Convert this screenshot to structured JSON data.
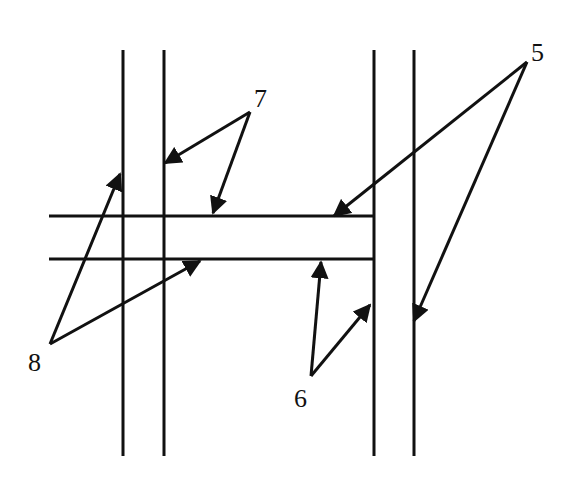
{
  "diagram": {
    "type": "structural-cross-section-schematic",
    "colors": {
      "line": "#111111",
      "background": "#ffffff"
    },
    "vertical_members": [
      {
        "id": "left-pair-outer",
        "x": 123,
        "y1": 50,
        "y2": 456
      },
      {
        "id": "left-pair-inner",
        "x": 164,
        "y1": 50,
        "y2": 456
      },
      {
        "id": "right-pair-inner",
        "x": 374,
        "y1": 50,
        "y2": 456
      },
      {
        "id": "right-pair-outer",
        "x": 414,
        "y1": 50,
        "y2": 456
      }
    ],
    "horizontal_members": [
      {
        "id": "beam-top",
        "y": 216,
        "x1": 49,
        "x2": 374
      },
      {
        "id": "beam-bottom",
        "y": 259,
        "x1": 49,
        "x2": 374
      }
    ],
    "labels": [
      {
        "id": "label-5",
        "text": "5",
        "x": 531,
        "y": 40
      },
      {
        "id": "label-6",
        "text": "6",
        "x": 294,
        "y": 386
      },
      {
        "id": "label-7",
        "text": "7",
        "x": 254,
        "y": 86
      },
      {
        "id": "label-8",
        "text": "8",
        "x": 28,
        "y": 350
      }
    ],
    "leaders": [
      {
        "label": "5",
        "from": [
          527,
          62
        ],
        "to": [
          334,
          216
        ]
      },
      {
        "label": "5",
        "from": [
          527,
          62
        ],
        "to": [
          414,
          321
        ]
      },
      {
        "label": "6",
        "from": [
          311,
          376
        ],
        "to": [
          321,
          262
        ]
      },
      {
        "label": "6",
        "from": [
          311,
          376
        ],
        "to": [
          370,
          305
        ]
      },
      {
        "label": "7",
        "from": [
          250,
          112
        ],
        "to": [
          165,
          163
        ]
      },
      {
        "label": "7",
        "from": [
          250,
          112
        ],
        "to": [
          213,
          213
        ]
      },
      {
        "label": "8",
        "from": [
          50,
          344
        ],
        "to": [
          120,
          174
        ]
      },
      {
        "label": "8",
        "from": [
          50,
          344
        ],
        "to": [
          200,
          261
        ]
      }
    ]
  }
}
